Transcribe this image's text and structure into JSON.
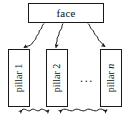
{
  "diagram": {
    "colors": {
      "stroke": "#1a1a1a",
      "text": "#111111",
      "background": "#ffffff"
    },
    "root": {
      "label": "face"
    },
    "pillars": [
      {
        "label": "pillar 1",
        "name": "pillar",
        "index": "1"
      },
      {
        "label": "pillar 2",
        "name": "pillar",
        "index": "2"
      },
      {
        "label": "pillar n",
        "name": "pillar",
        "index": "n"
      }
    ],
    "ellipsis": "...",
    "edges": {
      "top_label": "",
      "bottom_label": "",
      "top_style": "wavy-arrow-down",
      "bottom_style": "wavy-arrow-bidirectional"
    }
  }
}
